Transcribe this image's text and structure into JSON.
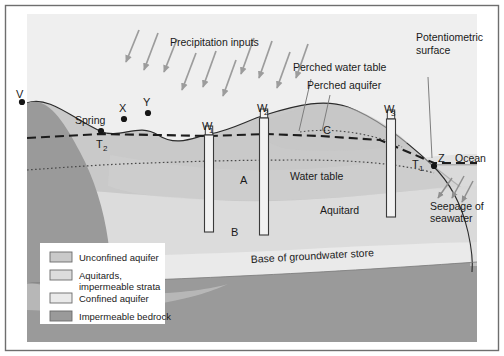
{
  "figure": {
    "type": "cross-section-diagram",
    "frame_color": "#6e6e6e",
    "background_color": "#ffffff"
  },
  "colors": {
    "sky": "#eeeeee",
    "unconfined_aquifer": "#c9c9c9",
    "aquitard": "#dcdcdc",
    "confined_aquifer": "#e9e9e9",
    "bedrock": "#9a9a9a",
    "ocean": "#e4e4e4",
    "line": "#2b2b2b",
    "arrow_gray": "#9c9c9c",
    "legend_bg": "#ffffff",
    "text": "#1a1a1a"
  },
  "labels": {
    "precipitation": "Precipitation inputs",
    "perched_water_table": "Perched water table",
    "perched_aquifer": "Perched aquifer",
    "potentiometric_surface_l1": "Potentiometric",
    "potentiometric_surface_l2": "surface",
    "water_table": "Water table",
    "aquitard": "Aquitard",
    "base_of_groundwater_store": "Base of groundwater store",
    "seepage_l1": "Seepage of",
    "seepage_l2": "seawater",
    "ocean": "Ocean",
    "spring": "Spring"
  },
  "point_labels": {
    "v": "V",
    "x": "X",
    "y": "Y",
    "z": "Z",
    "t1": "T",
    "t1_sub": "1",
    "t2": "T",
    "t2_sub": "2",
    "a": "A",
    "b": "B",
    "c": "C"
  },
  "wells": [
    {
      "id": "w1",
      "label": "W",
      "sub": "1",
      "label_x": 210,
      "label_y": 130,
      "x": 209,
      "top": 135,
      "bottom": 232,
      "width": 9,
      "casing_top": 126
    },
    {
      "id": "w2",
      "label": "W",
      "sub": "2",
      "label_x": 265,
      "label_y": 112,
      "x": 264,
      "top": 118,
      "bottom": 235,
      "width": 9,
      "casing_top": 109
    },
    {
      "id": "w3",
      "label": "W",
      "sub": "3",
      "label_x": 392,
      "label_y": 113,
      "x": 391,
      "top": 119,
      "bottom": 217,
      "width": 9,
      "casing_top": 110
    }
  ],
  "legend": {
    "items": [
      {
        "label": "Unconfined aquifer",
        "swatch": "#c9c9c9"
      },
      {
        "label": "Aquitards,",
        "label2": "impermeable strata",
        "swatch": "#dcdcdc"
      },
      {
        "label": "Confined aquifer",
        "swatch": "#eaeaea"
      },
      {
        "label": "Impermeable bedrock",
        "swatch": "#9a9a9a"
      }
    ]
  },
  "chart_data": {
    "type": "diagram",
    "annotations": [
      "Precipitation inputs",
      "Perched water table",
      "Perched aquifer",
      "Potentiometric surface",
      "Water table",
      "Aquitard",
      "Base of groundwater store",
      "Seepage of seawater",
      "Ocean",
      "Spring"
    ],
    "points": [
      "V",
      "X",
      "Y",
      "Z",
      "T1",
      "T2",
      "A",
      "B",
      "C"
    ],
    "wells": [
      "W1",
      "W2",
      "W3"
    ]
  }
}
